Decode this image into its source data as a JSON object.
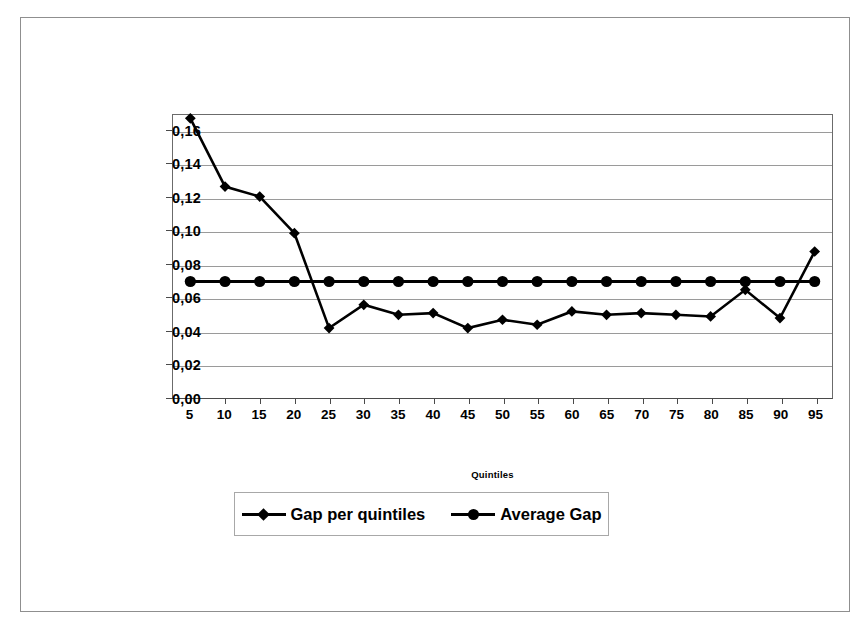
{
  "chart_data": {
    "type": "line",
    "title": "",
    "xlabel": "Quintiles",
    "ylabel": "",
    "categories": [
      "5",
      "10",
      "15",
      "20",
      "25",
      "30",
      "35",
      "40",
      "45",
      "50",
      "55",
      "60",
      "65",
      "70",
      "75",
      "80",
      "85",
      "90",
      "95"
    ],
    "series": [
      {
        "name": "Gap per quintiles",
        "marker": "diamond",
        "values": [
          0.168,
          0.127,
          0.121,
          0.099,
          0.042,
          0.056,
          0.05,
          0.051,
          0.042,
          0.047,
          0.044,
          0.052,
          0.05,
          0.051,
          0.05,
          0.049,
          0.065,
          0.048,
          0.088
        ]
      },
      {
        "name": "Average Gap",
        "marker": "circle",
        "values": [
          0.07,
          0.07,
          0.07,
          0.07,
          0.07,
          0.07,
          0.07,
          0.07,
          0.07,
          0.07,
          0.07,
          0.07,
          0.07,
          0.07,
          0.07,
          0.07,
          0.07,
          0.07,
          0.07
        ]
      }
    ],
    "ylim": [
      0.0,
      0.17
    ],
    "yticks": [
      0.0,
      0.02,
      0.04,
      0.06,
      0.08,
      0.1,
      0.12,
      0.14,
      0.16
    ],
    "ytick_labels": [
      "0,00",
      "0,02",
      "0,04",
      "0,06",
      "0,08",
      "0,10",
      "0,12",
      "0,14",
      "0,16"
    ],
    "grid": true,
    "legend_position": "bottom",
    "line_color": "#000000",
    "grid_color": "#9a9a9a"
  },
  "legend": {
    "entries": [
      {
        "label": "Gap per quintiles",
        "marker": "diamond-marker-icon"
      },
      {
        "label": "Average Gap",
        "marker": "circle-marker-icon"
      }
    ]
  },
  "axis": {
    "x_title": "Quintiles"
  }
}
